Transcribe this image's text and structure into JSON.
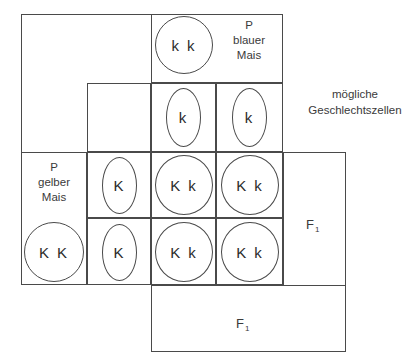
{
  "diagram": {
    "line_color": "#4a4a4a",
    "text_color": "#3a3a3a",
    "background": "#ffffff"
  },
  "parents": {
    "paternal": {
      "line1": "P",
      "line2": "blauer",
      "line3": "Mais",
      "genotype": "k k"
    },
    "maternal": {
      "line1": "P",
      "line2": "gelber",
      "line3": "Mais",
      "genotype": "K K"
    }
  },
  "gametes": {
    "caption": "mögliche\nGeschlechtszellen",
    "paternal": [
      "k",
      "k"
    ],
    "maternal": [
      "K",
      "K"
    ]
  },
  "offspring": {
    "generation_label": "F",
    "generation_subscript": "1",
    "grid": [
      [
        "K k",
        "K k"
      ],
      [
        "K k",
        "K k"
      ]
    ]
  }
}
